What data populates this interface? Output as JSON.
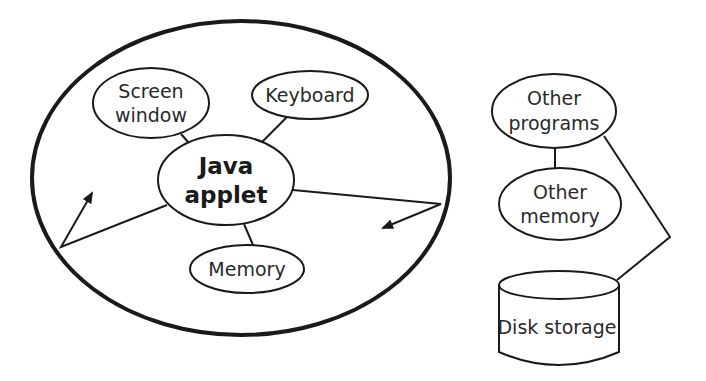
{
  "diagram": {
    "stroke_color": "#1a1a1a",
    "background": "#ffffff",
    "applet_boundary": {
      "shape": "ellipse"
    },
    "nodes": {
      "java_applet": {
        "lines": [
          "Java",
          "applet"
        ]
      },
      "screen_window": {
        "lines": [
          "Screen",
          "window"
        ]
      },
      "keyboard": {
        "lines": [
          "Keyboard"
        ]
      },
      "memory": {
        "lines": [
          "Memory"
        ]
      },
      "other_programs": {
        "lines": [
          "Other",
          "programs"
        ]
      },
      "other_memory": {
        "lines": [
          "Other",
          "memory"
        ]
      },
      "disk_storage": {
        "lines": [
          "Disk storage"
        ]
      }
    },
    "edges": [
      {
        "from": "java_applet",
        "to": "screen_window",
        "type": "line"
      },
      {
        "from": "java_applet",
        "to": "keyboard",
        "type": "line"
      },
      {
        "from": "java_applet",
        "to": "memory",
        "type": "line"
      },
      {
        "from": "java_applet",
        "to": "applet_boundary",
        "type": "blocked-arrow-left"
      },
      {
        "from": "java_applet",
        "to": "applet_boundary",
        "type": "blocked-arrow-right"
      },
      {
        "from": "other_programs",
        "to": "other_memory",
        "type": "line"
      },
      {
        "from": "other_programs",
        "to": "disk_storage",
        "type": "line"
      }
    ]
  }
}
